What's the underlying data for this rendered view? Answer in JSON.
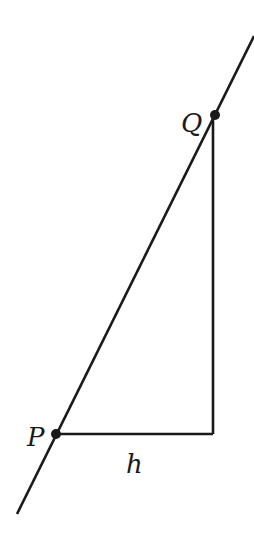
{
  "diagram": {
    "type": "secant-line-triangle",
    "colors": {
      "stroke": "#1a1a1a",
      "background": "#ffffff"
    },
    "line": {
      "x1": 17,
      "y1": 514,
      "x2": 254,
      "y2": 36
    },
    "points": [
      {
        "id": "P",
        "label": "P",
        "x": 56,
        "y": 434
      },
      {
        "id": "Q",
        "label": "Q",
        "x": 215,
        "y": 115
      }
    ],
    "corner": {
      "x": 213,
      "y": 434
    },
    "labels": {
      "P": "P",
      "Q": "Q",
      "h": "h"
    }
  }
}
